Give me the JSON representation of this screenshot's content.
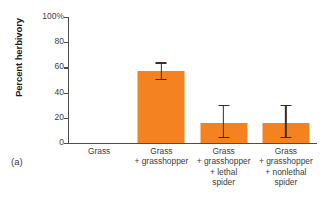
{
  "panel": {
    "label": "(a)"
  },
  "chart_data": {
    "type": "bar",
    "title": "",
    "xlabel": "",
    "ylabel": "Percent herbivory",
    "ylim": [
      0,
      100
    ],
    "yticks": [
      0,
      20,
      40,
      60,
      80,
      100
    ],
    "ytick_labels": [
      "0",
      "20",
      "40",
      "60",
      "80",
      "100%"
    ],
    "grid": false,
    "legend": null,
    "bar_color": "#F58220",
    "error_bar_color": "#3b2b20",
    "categories": [
      "Grass",
      "Grass\n+ grasshopper",
      "Grass\n+ grasshopper\n+ lethal\nspider",
      "Grass\n+ grasshopper\n+ nonlethal\nspider"
    ],
    "category_lines": [
      [
        "Grass"
      ],
      [
        "Grass",
        "+ grasshopper"
      ],
      [
        "Grass",
        "+ grasshopper",
        "+ lethal",
        "spider"
      ],
      [
        "Grass",
        "+ grasshopper",
        "+ nonlethal",
        "spider"
      ]
    ],
    "values": [
      0,
      57,
      16,
      16
    ],
    "error_low": [
      0,
      50,
      4,
      4
    ],
    "error_high": [
      0,
      64,
      30,
      30
    ]
  }
}
